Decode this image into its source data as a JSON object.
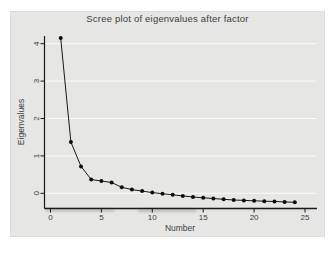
{
  "chart_data": {
    "type": "line",
    "title": "Scree plot of eigenvalues after factor",
    "xlabel": "Number",
    "ylabel": "Eigenvalues",
    "x": [
      1,
      2,
      3,
      4,
      5,
      6,
      7,
      8,
      9,
      10,
      11,
      12,
      13,
      14,
      15,
      16,
      17,
      18,
      19,
      20,
      21,
      22,
      23,
      24
    ],
    "values": [
      4.15,
      1.37,
      0.72,
      0.37,
      0.33,
      0.29,
      0.16,
      0.1,
      0.06,
      0.02,
      -0.01,
      -0.04,
      -0.07,
      -0.1,
      -0.12,
      -0.14,
      -0.16,
      -0.18,
      -0.19,
      -0.2,
      -0.21,
      -0.22,
      -0.23,
      -0.24
    ],
    "xticks": [
      0,
      5,
      10,
      15,
      20,
      25
    ],
    "xtick_labels": [
      "0",
      "5",
      "10",
      "15",
      "20",
      "25"
    ],
    "yticks": [
      0,
      1,
      2,
      3,
      4
    ],
    "ytick_labels": [
      "0",
      "1",
      "2",
      "3",
      "4"
    ],
    "xlim": [
      -0.6,
      26.1
    ],
    "ylim": [
      -0.41,
      4.21
    ],
    "grid": "horizontal-only",
    "legend": "none",
    "marker": "filled-circle",
    "colors": {
      "background": "#e6e6e5",
      "plot_background": "#e6e6e5",
      "gridline": "#fcfcfc",
      "axis": "#1a1a1a",
      "series_line": "#1a1a1a",
      "marker_fill": "#0d0d0d",
      "text": "#3d3d3d"
    }
  }
}
